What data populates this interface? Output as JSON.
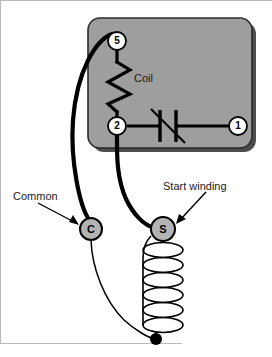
{
  "diagram": {
    "type": "electrical-schematic",
    "labels": {
      "coil": "Coil",
      "common": "Common",
      "start_winding": "Start winding"
    },
    "terminals": [
      {
        "id": "t5",
        "label": "5",
        "cx": 117,
        "cy": 41,
        "r": 9,
        "fill": "#ffffff",
        "stroke": "#000000"
      },
      {
        "id": "t2",
        "label": "2",
        "cx": 117,
        "cy": 126,
        "r": 9,
        "fill": "#ffffff",
        "stroke": "#000000"
      },
      {
        "id": "t1",
        "label": "1",
        "cx": 238,
        "cy": 126,
        "r": 9,
        "fill": "#ffffff",
        "stroke": "#000000"
      },
      {
        "id": "tC",
        "label": "C",
        "cx": 91,
        "cy": 229,
        "r": 11,
        "fill": "#b3b3b3",
        "stroke": "#000000"
      },
      {
        "id": "tS",
        "label": "S",
        "cx": 163,
        "cy": 229,
        "r": 12,
        "fill": "#b3b3b3",
        "stroke": "#000000"
      }
    ],
    "relay_box": {
      "x": 88,
      "y": 18,
      "width": 164,
      "height": 130,
      "radius": 12,
      "fill": "#9e9e9e",
      "stroke": "#2b2b2b",
      "shadow_fill": "#4d4d4d"
    },
    "colors": {
      "background": "#ffffff",
      "box_fill": "#9e9e9e",
      "wire": "#000000",
      "terminal_gray": "#b3b3b3",
      "border_gray": "#b9b9b9",
      "text": "#1a1a1a"
    },
    "winding": {
      "loops": 6,
      "top_x": 163,
      "top_y": 243,
      "loop_rx": 20,
      "loop_ry": 7,
      "loop_spacing": 16,
      "end_dot": {
        "cx": 156,
        "cy": 339,
        "r": 6
      }
    },
    "contact_symbol": {
      "name": "normally-closed-contact",
      "bar1_x": 160,
      "bar2_x": 176,
      "bar_top": 110,
      "bar_bottom": 142,
      "slash_x1": 152,
      "slash_y1": 110,
      "slash_x2": 184,
      "slash_y2": 142
    },
    "arrows": [
      {
        "name": "common-arrow",
        "x1": 38,
        "y1": 203,
        "x2": 79,
        "y2": 225
      },
      {
        "name": "start-winding-arrow",
        "x1": 204,
        "y1": 193,
        "x2": 177,
        "y2": 222
      }
    ]
  }
}
